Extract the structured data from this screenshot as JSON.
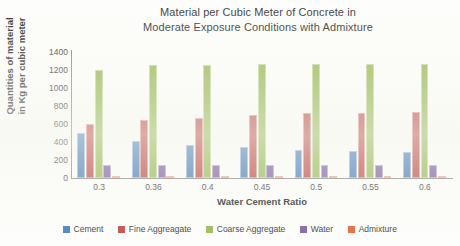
{
  "chart_data": {
    "type": "bar",
    "title": "Material per Cubic Meter of Concrete in Moderate Exposure Conditions with Admixture",
    "title_lines": [
      "Material per Cubic Meter of Concrete in",
      "Moderate Exposure Conditions with Admixture"
    ],
    "xlabel": "Water Cement Ratio",
    "ylabel": "Quantities of material in Kg per cubic meter",
    "ylabel_lines": [
      "Quantities of material",
      "in Kg per cubic meter"
    ],
    "categories": [
      "0.3",
      "0.36",
      "0.4",
      "0.45",
      "0.5",
      "0.55",
      "0.6"
    ],
    "ylim": [
      0,
      1400
    ],
    "yticks": [
      0,
      200,
      400,
      600,
      800,
      1000,
      1200,
      1400
    ],
    "ytick_labels": [
      "0",
      "200",
      "400",
      "600",
      "800",
      "1000",
      "1200",
      "1400"
    ],
    "grid": false,
    "legend_position": "bottom",
    "series": [
      {
        "name": "Cement",
        "color": "#4F81BD",
        "values": [
          500,
          415,
          370,
          340,
          310,
          300,
          290
        ]
      },
      {
        "name": "Fine Aggreagate",
        "color": "#C0504D",
        "values": [
          600,
          640,
          670,
          700,
          720,
          725,
          730
        ]
      },
      {
        "name": "Coarse Aggregate",
        "color": "#9BBB59",
        "values": [
          1200,
          1255,
          1260,
          1265,
          1270,
          1270,
          1270
        ]
      },
      {
        "name": "Water",
        "color": "#8064A2",
        "values": [
          150,
          150,
          148,
          150,
          150,
          150,
          150
        ]
      },
      {
        "name": "Admixture",
        "color": "#E8663D",
        "values": [
          10,
          8,
          7,
          7,
          6,
          6,
          6
        ]
      }
    ]
  },
  "legend": {
    "items": [
      {
        "label": "Cement",
        "color": "#4F81BD"
      },
      {
        "label": "Fine Aggreagate",
        "color": "#C0504D"
      },
      {
        "label": "Coarse Aggregate",
        "color": "#9BBB59"
      },
      {
        "label": "Water",
        "color": "#8064A2"
      },
      {
        "label": "Admixture",
        "color": "#E8663D"
      }
    ]
  }
}
